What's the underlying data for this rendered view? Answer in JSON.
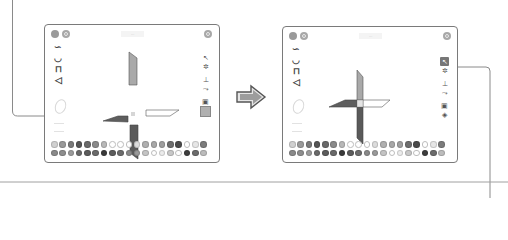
{
  "diagram": {
    "arrow_icon": "right-arrow-icon"
  },
  "panels": [
    {
      "id": "before",
      "title": "...",
      "top_left_buttons": [
        "menu-icon",
        "undo-icon"
      ],
      "top_right_button": "settings-icon",
      "left_tools": [
        "squiggle-tool",
        "arc-tool",
        "rectangle-tool",
        "triangle-tool"
      ],
      "left_ghost_tools": [
        "ellipse-tool",
        "line-tool",
        "line-tool"
      ],
      "right_tools": [
        "select-tool",
        "rotate-tool",
        "align-tool",
        "flip-tool",
        "image-tool",
        "layer-tool"
      ],
      "selected_right_tool": "layer-tool",
      "canvas": {
        "shape": "pinwheel",
        "state": "separated",
        "blades": [
          {
            "position": "top",
            "fill": "#a9a9a9"
          },
          {
            "position": "right",
            "fill": "#ffffff"
          },
          {
            "position": "bottom",
            "fill": "#5a5a5a"
          },
          {
            "position": "left",
            "fill": "#5e5e5e"
          }
        ],
        "center_marker_color": "#d6d6d6"
      },
      "palette": {
        "row1": [
          "#d0d0d0",
          "#9a9a9a",
          "#7a7a7a",
          "#555555",
          "#6a6a6a",
          "#8a8a8a",
          "#b8b8b8",
          "#ffffff",
          "#ffffff",
          "#ffffff",
          "#dcdcdc",
          "#b0b0b0",
          "#a8a8a8",
          "#a0a0a0",
          "#6e6e6e",
          "#4a4a4a",
          "#ffffff",
          "#e6e6e6",
          "#7c7c7c",
          "#1e1e1e"
        ],
        "row2": [
          "#8a8a8a",
          "#8e8e8e",
          "#9c9c9c",
          "#6a6a6a",
          "#5c5c5c",
          "#6a6a6a",
          "#3a3a3a",
          "#5c5c5c",
          "#6c6c6c",
          "#8a8a8a",
          "#9a9a9a",
          "#c4c4c4",
          "#ffffff",
          "#ececec",
          "#c8c8c8",
          "#ffffff",
          "#3e3e3e",
          "#6c6c6c",
          "#bcbcbc",
          "#ffffff"
        ]
      }
    },
    {
      "id": "after",
      "title": "...",
      "top_left_buttons": [
        "menu-icon",
        "undo-icon"
      ],
      "top_right_button": "settings-icon",
      "left_tools": [
        "squiggle-tool",
        "arc-tool",
        "rectangle-tool",
        "triangle-tool"
      ],
      "left_ghost_tools": [
        "ellipse-tool",
        "line-tool",
        "line-tool"
      ],
      "right_tools": [
        "select-tool",
        "rotate-tool",
        "align-tool",
        "flip-tool",
        "image-tool",
        "layer-tool"
      ],
      "selected_right_tool": "select-tool",
      "canvas": {
        "shape": "pinwheel",
        "state": "joined",
        "blades": [
          {
            "position": "top",
            "fill": "#a9a9a9"
          },
          {
            "position": "right",
            "fill": "#ffffff"
          },
          {
            "position": "bottom",
            "fill": "#5a5a5a"
          },
          {
            "position": "left",
            "fill": "#5e5e5e"
          }
        ],
        "center_marker_color": "#e4e4e4"
      },
      "palette": {
        "row1": [
          "#d0d0d0",
          "#9a9a9a",
          "#7a7a7a",
          "#555555",
          "#6a6a6a",
          "#8a8a8a",
          "#b8b8b8",
          "#ffffff",
          "#ffffff",
          "#ffffff",
          "#dcdcdc",
          "#b0b0b0",
          "#a8a8a8",
          "#a0a0a0",
          "#6e6e6e",
          "#4a4a4a",
          "#ffffff",
          "#e6e6e6",
          "#7c7c7c",
          "#1e1e1e"
        ],
        "row2": [
          "#8a8a8a",
          "#8e8e8e",
          "#9c9c9c",
          "#6a6a6a",
          "#5c5c5c",
          "#6a6a6a",
          "#3a3a3a",
          "#5c5c5c",
          "#6c6c6c",
          "#8a8a8a",
          "#9a9a9a",
          "#c4c4c4",
          "#ffffff",
          "#ececec",
          "#c8c8c8",
          "#ffffff",
          "#3e3e3e",
          "#6c6c6c",
          "#bcbcbc",
          "#ffffff"
        ]
      }
    }
  ],
  "callouts": [
    {
      "target": "before-panel-left-toolbar",
      "label": ""
    },
    {
      "target": "after-panel-rotate-tool",
      "label": ""
    }
  ],
  "colors": {
    "panel_border": "#7a7a7a",
    "callout_line": "#8a8a8a",
    "divider": "#9a9a9a"
  },
  "icon_glyphs": {
    "squiggle-tool": "∽",
    "arc-tool": "◡",
    "rectangle-tool": "⊓",
    "triangle-tool": "◁",
    "select-tool": "↖",
    "rotate-tool": "✲",
    "align-tool": "⊥",
    "flip-tool": "⤳",
    "image-tool": "▣",
    "layer-tool": "◈"
  }
}
